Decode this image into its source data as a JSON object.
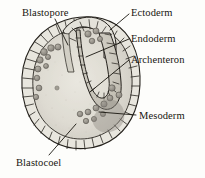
{
  "figure": {
    "background_color": "#fdfdfb",
    "ink_color": "#17150f",
    "labels": [
      {
        "id": "blastopore",
        "text": "Blastopore",
        "position": "top-left"
      },
      {
        "id": "ectoderm",
        "text": "Ectoderm",
        "position": "top-right"
      },
      {
        "id": "endoderm",
        "text": "Endoderm",
        "position": "right"
      },
      {
        "id": "archenteron",
        "text": "Archenteron",
        "position": "right"
      },
      {
        "id": "mesoderm",
        "text": "Mesoderm",
        "position": "right-lower"
      },
      {
        "id": "blastocoel",
        "text": "Blastocoel",
        "position": "bottom-left"
      }
    ],
    "structures": {
      "ectoderm_layer": {
        "name": "ectoderm",
        "fill": "#e6e4dc",
        "stroke": "#2b2823"
      },
      "archenteron_cavity": {
        "name": "archenteron",
        "fill": "#cfccc2"
      },
      "blastocoel_cavity": {
        "name": "blastocoel",
        "fill": "#dedbd2"
      },
      "mesoderm_cells": {
        "name": "mesoderm",
        "fill": "#9a968c",
        "count": 24
      },
      "blastopore_groove": {
        "name": "blastopore",
        "fill": "#d4d1c7"
      }
    },
    "leader_lines": [
      {
        "from": "blastopore",
        "to": "blastopore-groove"
      },
      {
        "from": "ectoderm",
        "to": "outer-cell-layer"
      },
      {
        "from": "endoderm",
        "to": "archenteron-wall"
      },
      {
        "from": "archenteron",
        "to": "archenteron-cavity"
      },
      {
        "from": "mesoderm",
        "to": "mesoderm-cell-cluster"
      },
      {
        "from": "blastocoel",
        "to": "blastocoel-cavity"
      }
    ]
  }
}
